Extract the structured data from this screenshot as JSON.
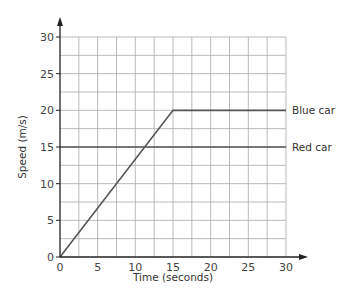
{
  "chart_data": {
    "type": "line",
    "title": "",
    "xlabel": "Time (seconds)",
    "ylabel": "Speed (m/s)",
    "xlim": [
      0,
      30
    ],
    "ylim": [
      0,
      30
    ],
    "xticks": [
      0,
      5,
      10,
      15,
      20,
      25,
      30
    ],
    "yticks": [
      0,
      5,
      10,
      15,
      20,
      25,
      30
    ],
    "grid": true,
    "grid_step_x": 2.5,
    "grid_step_y": 2.5,
    "legend_position": "inline-right",
    "series": [
      {
        "name": "Blue car",
        "x": [
          0,
          15,
          30
        ],
        "y": [
          0,
          20,
          20
        ],
        "color": "#555555"
      },
      {
        "name": "Red car",
        "x": [
          0,
          30
        ],
        "y": [
          15,
          15
        ],
        "color": "#555555"
      }
    ]
  },
  "colors": {
    "grid": "#aaaaaa",
    "axis": "#222222",
    "series": "#555555",
    "text": "#333333"
  }
}
